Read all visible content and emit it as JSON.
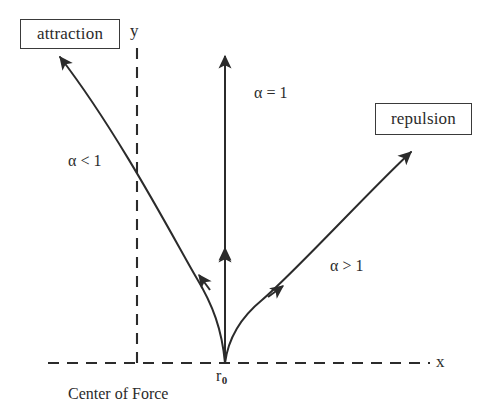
{
  "diagram": {
    "axes": {
      "x_label": "x",
      "y_label": "y",
      "origin_label": "r",
      "origin_label_subscript": "0",
      "origin_caption": "Center of Force",
      "x_axis_style": "dashed",
      "y_axis_style": "dashed"
    },
    "boxes": [
      {
        "id": "attraction",
        "label": "attraction"
      },
      {
        "id": "repulsion",
        "label": "repulsion"
      }
    ],
    "curves": [
      {
        "id": "alpha-less-than-one",
        "label": "α < 1",
        "direction": "up-left",
        "endpoint": "attraction"
      },
      {
        "id": "alpha-equals-one",
        "label": "α = 1",
        "direction": "up",
        "endpoint": "vertical"
      },
      {
        "id": "alpha-greater-than-one",
        "label": "α > 1",
        "direction": "up-right",
        "endpoint": "repulsion"
      }
    ],
    "colors": {
      "stroke": "#2b2b2b",
      "text": "#2b2b2b",
      "background": "#ffffff"
    }
  }
}
